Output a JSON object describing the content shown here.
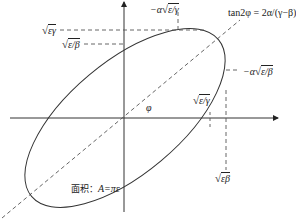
{
  "diagram": {
    "type": "phase-space ellipse (Courant–Snyder / Twiss)",
    "formula": {
      "label": "tan2φ = 2α/(γ−β)",
      "lhs": "tan2φ",
      "rhs": "2α/(γ−β)"
    },
    "angle_label": "φ",
    "area_label": {
      "prefix": "面积：",
      "expr": "A=πε"
    },
    "axis_labels": {
      "x_positive_intercept": {
        "radicand": "ε/γ",
        "prefix": ""
      },
      "x_max": {
        "radicand": "εβ",
        "prefix": ""
      },
      "y_max": {
        "radicand": "εγ",
        "prefix": ""
      },
      "y_intercept": {
        "radicand": "ε/β",
        "prefix": ""
      },
      "x_at_y_max": {
        "radicand": "ε/γ",
        "prefix": "−α"
      },
      "y_at_x_max": {
        "radicand": "ε/β",
        "prefix": "−α"
      }
    },
    "colors": {
      "line": "#333333",
      "dashed": "#555555",
      "background": "#ffffff"
    }
  }
}
